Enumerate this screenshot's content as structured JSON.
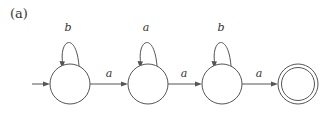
{
  "figure": {
    "caption": "(a)",
    "type": "finite automaton state diagram",
    "colors": {
      "stroke": "#555555",
      "text": "#333333",
      "background": "#ffffff"
    }
  },
  "states": [
    {
      "id": "q0",
      "cx": 70,
      "cy": 84,
      "r": 20,
      "initial": true,
      "accepting": false
    },
    {
      "id": "q1",
      "cx": 148,
      "cy": 84,
      "r": 20,
      "initial": false,
      "accepting": false
    },
    {
      "id": "q2",
      "cx": 222,
      "cy": 84,
      "r": 20,
      "initial": false,
      "accepting": false
    },
    {
      "id": "q3",
      "cx": 298,
      "cy": 84,
      "r": 20,
      "initial": false,
      "accepting": true
    }
  ],
  "transitions": [
    {
      "from": "q0",
      "to": "q0",
      "label": "b"
    },
    {
      "from": "q0",
      "to": "q1",
      "label": "a"
    },
    {
      "from": "q1",
      "to": "q1",
      "label": "a"
    },
    {
      "from": "q1",
      "to": "q2",
      "label": "a"
    },
    {
      "from": "q2",
      "to": "q2",
      "label": "b"
    },
    {
      "from": "q2",
      "to": "q3",
      "label": "a"
    }
  ]
}
